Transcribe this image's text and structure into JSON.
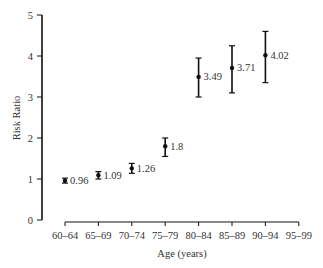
{
  "chart_data": {
    "type": "scatter",
    "title": "",
    "xlabel": "Age (years)",
    "ylabel": "Risk Ratio",
    "ylim": [
      0,
      5
    ],
    "yticks": [
      0,
      1,
      2,
      3,
      4,
      5
    ],
    "grid": false,
    "legend": null,
    "categories": [
      "60–64",
      "65–69",
      "70–74",
      "75–79",
      "80–84",
      "85–89",
      "90–94",
      "95–99"
    ],
    "values": [
      0.96,
      1.09,
      1.26,
      1.8,
      3.49,
      3.71,
      4.02,
      null
    ],
    "value_labels": [
      "0.96",
      "1.09",
      "1.26",
      "1.8",
      "3.49",
      "3.71",
      "4.02",
      ""
    ],
    "error_low": [
      0.9,
      1.0,
      1.14,
      1.55,
      3.0,
      3.1,
      3.35,
      null
    ],
    "error_high": [
      1.02,
      1.18,
      1.38,
      2.0,
      3.95,
      4.25,
      4.6,
      null
    ]
  },
  "colors": {
    "ink": "#111111",
    "text": "#333333"
  }
}
